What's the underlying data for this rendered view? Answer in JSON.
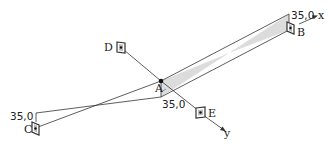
{
  "diagram": {
    "type": "3d-axis-geometry",
    "points": {
      "A": {
        "label": "A",
        "pos": [
          161,
          81
        ]
      },
      "B": {
        "label": "B",
        "pos": [
          291,
          27
        ]
      },
      "C": {
        "label": "C",
        "pos": [
          36,
          128
        ]
      },
      "D": {
        "label": "D",
        "pos": [
          121,
          48
        ]
      },
      "E": {
        "label": "E",
        "pos": [
          201,
          113
        ]
      }
    },
    "axes": {
      "x": {
        "label": "x"
      },
      "y": {
        "label": "y"
      }
    },
    "dimensions": {
      "near_B": "35,0",
      "near_A": "35,0",
      "near_C": "35,0"
    },
    "colors": {
      "line": "#333333",
      "shade": "#d9d9d9",
      "text": "#222222"
    }
  }
}
